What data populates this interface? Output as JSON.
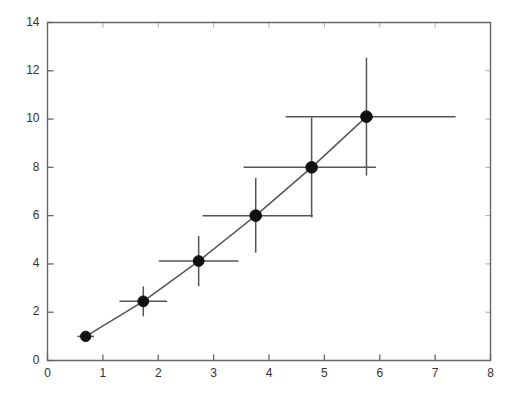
{
  "chart_data": {
    "type": "scatter",
    "title": "",
    "subtitle": "",
    "xlabel": "",
    "ylabel": "",
    "xlim": [
      0,
      8
    ],
    "ylim": [
      0,
      14
    ],
    "xticks": [
      0,
      1,
      2,
      3,
      4,
      5,
      6,
      7,
      8
    ],
    "yticks": [
      0,
      2,
      4,
      6,
      8,
      10,
      12,
      14
    ],
    "xtick_labels": [
      "0",
      "1",
      "2",
      "3",
      "4",
      "5",
      "6",
      "7",
      "8"
    ],
    "ytick_labels": [
      "0",
      "2",
      "4",
      "6",
      "8",
      "10",
      "12",
      "14"
    ],
    "grid": false,
    "legend": null,
    "annotations": [],
    "style": {
      "marker": "filled-circle",
      "marker_color": "#111111",
      "line_color": "#555555",
      "errorbar_color": "#555555",
      "axis_color": "#666666",
      "background": "#ffffff",
      "connected": true,
      "errorbars": "xy"
    },
    "series": [
      {
        "name": "measured",
        "x": [
          0.69,
          1.73,
          2.73,
          3.76,
          4.77,
          5.76
        ],
        "y": [
          1.0,
          2.45,
          4.12,
          6.0,
          8.0,
          10.1
        ],
        "xerr_low": [
          0.15,
          0.43,
          0.72,
          0.96,
          1.23,
          1.46
        ],
        "xerr_high": [
          0.15,
          0.43,
          0.72,
          1.03,
          1.16,
          1.61
        ],
        "yerr_low": [
          0.1,
          0.62,
          1.04,
          1.53,
          2.07,
          2.44
        ],
        "yerr_high": [
          0.1,
          0.62,
          1.04,
          1.57,
          2.07,
          2.44
        ]
      }
    ],
    "points": [
      {
        "x": 0.69,
        "y": 1.0,
        "xerr": 0.15,
        "yerr": 0.1
      },
      {
        "x": 1.73,
        "y": 2.45,
        "xerr": 0.43,
        "yerr": 0.62
      },
      {
        "x": 2.73,
        "y": 4.12,
        "xerr": 0.72,
        "yerr": 1.04
      },
      {
        "x": 3.76,
        "y": 6.0,
        "xerr": 1.0,
        "yerr": 1.55
      },
      {
        "x": 4.77,
        "y": 8.0,
        "xerr": 1.2,
        "yerr": 2.07
      },
      {
        "x": 5.76,
        "y": 10.1,
        "xerr": 1.54,
        "yerr": 2.44
      }
    ]
  }
}
